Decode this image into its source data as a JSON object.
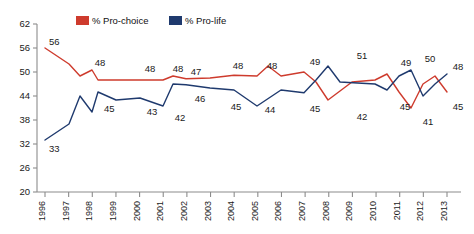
{
  "chart_data": {
    "type": "line",
    "title": "",
    "subtitle": "",
    "xlabel": "",
    "ylabel": "",
    "x": [
      "1996",
      "1997",
      "1998",
      "1999",
      "2000",
      "2001",
      "2002",
      "2003",
      "2004",
      "2005",
      "2006",
      "2007",
      "2008",
      "2009",
      "2010",
      "2011",
      "2012",
      "2013"
    ],
    "xlim": [
      1996,
      2013
    ],
    "ylim": [
      20,
      62
    ],
    "yticks": [
      20,
      26,
      32,
      38,
      44,
      50,
      56,
      62
    ],
    "grid": false,
    "legend_position": "top-center",
    "series": [
      {
        "name": "% Pro-choice",
        "color": "#CE3B2D",
        "values": [
          56,
          52,
          48,
          48,
          48,
          48,
          48,
          49,
          49,
          49,
          51,
          49,
          50,
          42,
          46,
          49,
          41,
          45
        ],
        "labels": {
          "1996": "56",
          "1998": "48",
          "2000": "48",
          "2001": "48",
          "2002": "47",
          "2004": "48",
          "2006": "48",
          "2008": "49",
          "2009": "42",
          "2011": "45",
          "2012": "41",
          "2013": "45"
        }
      },
      {
        "name": "% Pro-life",
        "color": "#1F3A6E",
        "values": [
          33,
          37,
          45,
          43,
          43,
          42,
          46,
          46,
          45,
          44,
          41,
          45,
          45,
          51,
          47,
          49,
          50,
          48
        ],
        "labels": {
          "1996": "33",
          "1998": "45",
          "2000": "43",
          "2001": "42",
          "2002": "46",
          "2004": "45",
          "2005": "44",
          "2007": "45",
          "2009": "51",
          "2011": "49",
          "2012": "50",
          "2013": "48"
        }
      }
    ],
    "vertices": {
      "pro_choice": [
        [
          45,
          56
        ],
        [
          69,
          52
        ],
        [
          80,
          49
        ],
        [
          92,
          50.5
        ],
        [
          98,
          48
        ],
        [
          140,
          48
        ],
        [
          163,
          48
        ],
        [
          173,
          49
        ],
        [
          186,
          48.3
        ],
        [
          210,
          48.5
        ],
        [
          234,
          49.2
        ],
        [
          257,
          49
        ],
        [
          268,
          51.5
        ],
        [
          281,
          49
        ],
        [
          304,
          50
        ],
        [
          316,
          47.5
        ],
        [
          328,
          43
        ],
        [
          352,
          47.5
        ],
        [
          375,
          48
        ],
        [
          387,
          49.5
        ],
        [
          399,
          45
        ],
        [
          411,
          41
        ],
        [
          423,
          47
        ],
        [
          435,
          49
        ],
        [
          447,
          45
        ]
      ],
      "pro_life": [
        [
          45,
          33
        ],
        [
          69,
          37
        ],
        [
          80,
          44
        ],
        [
          92,
          40
        ],
        [
          98,
          45
        ],
        [
          116,
          43
        ],
        [
          140,
          43.5
        ],
        [
          163,
          41.5
        ],
        [
          173,
          47
        ],
        [
          186,
          46.8
        ],
        [
          210,
          46
        ],
        [
          234,
          45.5
        ],
        [
          257,
          41.5
        ],
        [
          281,
          45.5
        ],
        [
          304,
          44.8
        ],
        [
          316,
          48
        ],
        [
          328,
          51.5
        ],
        [
          340,
          47.5
        ],
        [
          375,
          47
        ],
        [
          387,
          45.5
        ],
        [
          399,
          49
        ],
        [
          411,
          50.5
        ],
        [
          423,
          44
        ],
        [
          435,
          47
        ],
        [
          447,
          49.5
        ]
      ]
    }
  },
  "legend": {
    "items": [
      {
        "label": "% Pro-choice",
        "color": "#CE3B2D"
      },
      {
        "label": "% Pro-life",
        "color": "#1F3A6E"
      }
    ]
  },
  "axis": {
    "y_labels": [
      "62",
      "56",
      "50",
      "44",
      "38",
      "32",
      "26",
      "20"
    ],
    "x_labels": [
      "1996",
      "1997",
      "1998",
      "1999",
      "2000",
      "2001",
      "2002",
      "2003",
      "2004",
      "2005",
      "2006",
      "2007",
      "2008",
      "2009",
      "2010",
      "2011",
      "2012",
      "2013"
    ]
  },
  "data_labels": [
    {
      "text": "56",
      "x": 49,
      "y": 45,
      "color": "#1a1a1a",
      "anchor": "start"
    },
    {
      "text": "48",
      "x": 100,
      "y": 66,
      "color": "#1a1a1a",
      "anchor": "middle"
    },
    {
      "text": "48",
      "x": 150,
      "y": 72,
      "color": "#1a1a1a",
      "anchor": "middle"
    },
    {
      "text": "48",
      "x": 178,
      "y": 72,
      "color": "#1a1a1a",
      "anchor": "middle"
    },
    {
      "text": "47",
      "x": 196,
      "y": 75,
      "color": "#1a1a1a",
      "anchor": "middle"
    },
    {
      "text": "48",
      "x": 238,
      "y": 69,
      "color": "#1a1a1a",
      "anchor": "middle"
    },
    {
      "text": "48",
      "x": 272,
      "y": 69,
      "color": "#1a1a1a",
      "anchor": "middle"
    },
    {
      "text": "49",
      "x": 315,
      "y": 65,
      "color": "#1a1a1a",
      "anchor": "middle"
    },
    {
      "text": "42",
      "x": 362,
      "y": 120,
      "color": "#1a1a1a",
      "anchor": "middle"
    },
    {
      "text": "45",
      "x": 405,
      "y": 110,
      "color": "#1a1a1a",
      "anchor": "middle"
    },
    {
      "text": "41",
      "x": 428,
      "y": 125,
      "color": "#1a1a1a",
      "anchor": "middle"
    },
    {
      "text": "45",
      "x": 458,
      "y": 110,
      "color": "#1a1a1a",
      "anchor": "middle"
    },
    {
      "text": "33",
      "x": 49,
      "y": 152,
      "color": "#1a1a1a",
      "anchor": "start"
    },
    {
      "text": "45",
      "x": 104,
      "y": 112,
      "color": "#1a1a1a",
      "anchor": "start"
    },
    {
      "text": "43",
      "x": 152,
      "y": 115,
      "color": "#1a1a1a",
      "anchor": "middle"
    },
    {
      "text": "42",
      "x": 180,
      "y": 121,
      "color": "#1a1a1a",
      "anchor": "middle"
    },
    {
      "text": "46",
      "x": 200,
      "y": 102,
      "color": "#1a1a1a",
      "anchor": "middle"
    },
    {
      "text": "45",
      "x": 236,
      "y": 110,
      "color": "#1a1a1a",
      "anchor": "middle"
    },
    {
      "text": "44",
      "x": 270,
      "y": 113,
      "color": "#1a1a1a",
      "anchor": "middle"
    },
    {
      "text": "45",
      "x": 315,
      "y": 112,
      "color": "#1a1a1a",
      "anchor": "middle"
    },
    {
      "text": "51",
      "x": 362,
      "y": 59,
      "color": "#1a1a1a",
      "anchor": "middle"
    },
    {
      "text": "49",
      "x": 406,
      "y": 66,
      "color": "#1a1a1a",
      "anchor": "middle"
    },
    {
      "text": "50",
      "x": 430,
      "y": 62,
      "color": "#1a1a1a",
      "anchor": "middle"
    },
    {
      "text": "48",
      "x": 458,
      "y": 70,
      "color": "#1a1a1a",
      "anchor": "middle"
    }
  ]
}
